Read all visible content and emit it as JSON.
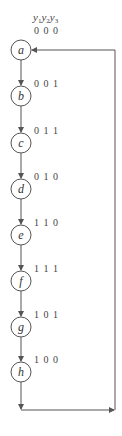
{
  "header": {
    "variables": [
      {
        "name": "y",
        "sub": "1"
      },
      {
        "name": "y",
        "sub": "2"
      },
      {
        "name": "y",
        "sub": "3"
      }
    ]
  },
  "states": [
    {
      "id": "a",
      "code": "0 0 0",
      "cy": 50
    },
    {
      "id": "b",
      "code": "0 0 1",
      "cy": 96
    },
    {
      "id": "c",
      "code": "0 1 1",
      "cy": 143
    },
    {
      "id": "d",
      "code": "0 1 0",
      "cy": 189
    },
    {
      "id": "e",
      "code": "1 1 0",
      "cy": 235
    },
    {
      "id": "f",
      "code": "1 1 1",
      "cy": 281
    },
    {
      "id": "g",
      "code": "1 0 1",
      "cy": 327
    },
    {
      "id": "h",
      "code": "1 0 0",
      "cy": 372
    }
  ],
  "colors": {
    "stroke": "#555555",
    "text": "#444444"
  }
}
